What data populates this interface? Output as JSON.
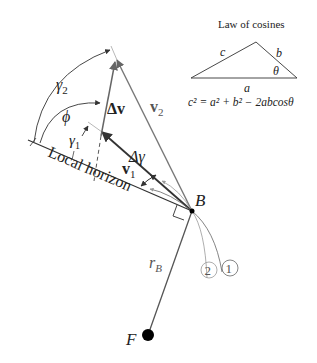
{
  "diagram": {
    "title": "Law of cosines",
    "formula": "c² = a² + b² − 2abcosθ",
    "inset_labels": {
      "a": "a",
      "b": "b",
      "c": "c",
      "theta": "θ"
    },
    "labels": {
      "gamma2": "γ",
      "gamma2_sub": "2",
      "phi": "ϕ",
      "gamma1": "γ",
      "gamma1_sub": "1",
      "delta_v": "Δv",
      "v2": "v",
      "v2_sub": "2",
      "v1": "v",
      "v1_sub": "1",
      "delta_gamma": "Δγ",
      "local_horizon": "Local horizon",
      "B": "B",
      "rB": "r",
      "rB_sub": "B",
      "F": "F",
      "orbit1": "1",
      "orbit2": "2"
    },
    "colors": {
      "line_dark": "#333333",
      "line_gray": "#777777",
      "line_light": "#aaaaaa",
      "background": "#ffffff"
    }
  }
}
